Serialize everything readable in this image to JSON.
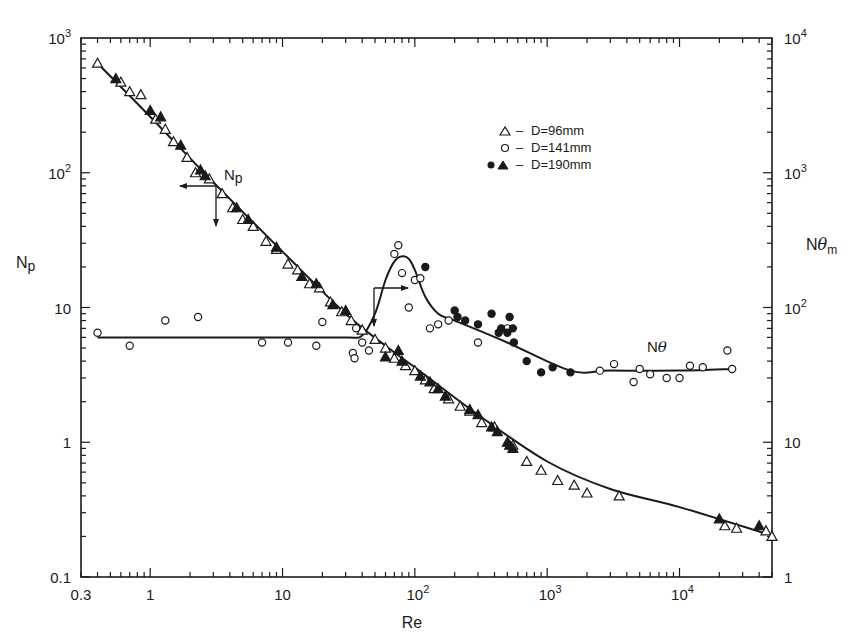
{
  "chart_data": {
    "type": "scatter",
    "title": "",
    "xlabel": "Re",
    "ylabel": "Np",
    "ylabel_right": "Nθm",
    "xscale": "log",
    "yscale": "log",
    "xlim": [
      0.3,
      50000
    ],
    "ylim": [
      0.1,
      1000
    ],
    "ylim_right": [
      1,
      10000
    ],
    "grid": false,
    "legend_position": "upper right (inside)",
    "x_tick_labels": [
      "0.3",
      "1",
      "10",
      "10^2",
      "10^3",
      "10^4"
    ],
    "x_tick_values": [
      0.3,
      1,
      10,
      100,
      1000,
      10000
    ],
    "y_tick_labels": [
      "0.1",
      "1",
      "10",
      "10^2",
      "10^3"
    ],
    "y_tick_values": [
      0.1,
      1,
      10,
      100,
      1000
    ],
    "y_right_tick_labels": [
      "1",
      "10",
      "10^2",
      "10^3",
      "10^4"
    ],
    "y_right_tick_values": [
      1,
      10,
      100,
      1000,
      10000
    ],
    "legend": [
      {
        "marker": "open-triangle",
        "label": "D=96mm"
      },
      {
        "marker": "open-circle",
        "label": "D=141mm"
      },
      {
        "marker": "filled-circle + filled-triangle",
        "label": "D=190mm"
      }
    ],
    "annotations": [
      {
        "text": "Np",
        "x": 3.5,
        "y": 80,
        "note": "arrows point left and down: curve read on left Np axis"
      },
      {
        "text": "Nθ",
        "x": 7000,
        "y": 5.5,
        "note": "arrows point right and down: Nθ curve read on right Nθm axis"
      }
    ],
    "curves": [
      {
        "name": "Np fit",
        "axis": "left",
        "x": [
          0.4,
          1,
          3,
          10,
          30,
          60,
          100,
          300,
          1000,
          3000,
          10000,
          45000
        ],
        "y": [
          650,
          260,
          85,
          26,
          9,
          5.2,
          3.6,
          1.6,
          0.72,
          0.45,
          0.33,
          0.21
        ]
      },
      {
        "name": "Nθ fit",
        "axis": "right",
        "x": [
          0.4,
          1,
          10,
          30,
          40,
          50,
          60,
          70,
          80,
          90,
          100,
          120,
          150,
          200,
          500,
          1500,
          3000,
          10000,
          25000
        ],
        "y": [
          60,
          60,
          60,
          60,
          62,
          90,
          160,
          220,
          240,
          230,
          190,
          120,
          90,
          80,
          55,
          34,
          34,
          34,
          35
        ]
      }
    ],
    "series": [
      {
        "name": "D=96mm (Np, open triangle)",
        "marker": "open-triangle",
        "axis": "left",
        "x": [
          0.4,
          0.6,
          0.7,
          0.85,
          1.1,
          1.3,
          1.5,
          1.9,
          2.2,
          2.8,
          3.5,
          4.2,
          5,
          6,
          7.5,
          9,
          11,
          13,
          16,
          19,
          23,
          28,
          33,
          40,
          50,
          60,
          70,
          85,
          100,
          120,
          140,
          180,
          220,
          260,
          320,
          400,
          550,
          700,
          900,
          1200,
          1600,
          2000,
          3500,
          22000,
          27000,
          45000,
          50000
        ],
        "y": [
          650,
          470,
          400,
          380,
          250,
          210,
          170,
          130,
          100,
          90,
          70,
          55,
          45,
          40,
          31,
          27,
          21,
          19,
          15,
          14,
          11,
          9.3,
          8,
          6.8,
          5.8,
          5.0,
          4.2,
          3.7,
          3.4,
          2.9,
          2.5,
          2.1,
          1.85,
          1.7,
          1.4,
          1.3,
          0.95,
          0.72,
          0.62,
          0.52,
          0.48,
          0.42,
          0.4,
          0.24,
          0.23,
          0.22,
          0.2
        ]
      },
      {
        "name": "D=190mm (Np, filled triangle)",
        "marker": "filled-triangle",
        "axis": "left",
        "x": [
          0.55,
          1.0,
          1.2,
          1.7,
          2.4,
          2.6,
          4.5,
          5.5,
          9,
          14,
          18,
          24,
          30,
          60,
          75,
          80,
          110,
          130,
          150,
          170,
          260,
          300,
          380,
          420,
          500,
          520,
          550,
          20000,
          40000
        ],
        "y": [
          500,
          290,
          260,
          160,
          105,
          95,
          55,
          45,
          28,
          17,
          15,
          10.5,
          9.5,
          4.3,
          4.8,
          4.0,
          3.1,
          2.8,
          2.5,
          2.2,
          1.75,
          1.6,
          1.3,
          1.2,
          1.0,
          0.95,
          0.9,
          0.27,
          0.24
        ]
      },
      {
        "name": "D=141mm (Nθm, open circle)",
        "marker": "open-circle",
        "axis": "right",
        "x": [
          0.4,
          0.7,
          1.3,
          2.3,
          7,
          11,
          18,
          20,
          34,
          35,
          36,
          40,
          45,
          70,
          75,
          80,
          90,
          100,
          110,
          130,
          150,
          180,
          300,
          500,
          2500,
          3200,
          4500,
          5000,
          6000,
          8000,
          10000,
          12000,
          15000,
          23000,
          25000
        ],
        "y": [
          65,
          52,
          80,
          85,
          55,
          55,
          52,
          78,
          46,
          42,
          70,
          55,
          48,
          250,
          290,
          180,
          100,
          160,
          165,
          70,
          75,
          80,
          55,
          70,
          34,
          38,
          28,
          35,
          32,
          30,
          30,
          37,
          36,
          48,
          35
        ]
      },
      {
        "name": "D=190mm (Nθm, filled circle)",
        "marker": "filled-circle",
        "axis": "right",
        "x": [
          120,
          200,
          210,
          240,
          300,
          380,
          430,
          450,
          500,
          520,
          550,
          560,
          700,
          900,
          1100,
          1500
        ],
        "y": [
          200,
          95,
          85,
          80,
          75,
          90,
          65,
          70,
          65,
          85,
          70,
          55,
          40,
          33,
          36,
          33
        ]
      }
    ]
  },
  "axes": {
    "x_label": "Re",
    "y_left_label": "Np",
    "y_right_label": "Nθm"
  },
  "legend": {
    "items": [
      {
        "symbol": "△ –",
        "text": "D=96mm"
      },
      {
        "symbol": "○ –",
        "text": "D=141mm"
      },
      {
        "symbol": "● ▲ –",
        "text": "D=190mm"
      }
    ]
  },
  "labels": {
    "np_curve": "Np",
    "ntheta_curve": "Nθ"
  }
}
